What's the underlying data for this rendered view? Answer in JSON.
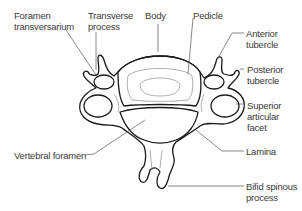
{
  "figure": {
    "labels": {
      "foramen_transversarium": [
        "Foramen",
        "transversarium"
      ],
      "transverse_process": [
        "Transverse",
        "process"
      ],
      "body": [
        "Body"
      ],
      "pedicle": [
        "Pedicle"
      ],
      "anterior_tubercle": [
        "Anterior",
        "tubercle"
      ],
      "posterior_tubercle": [
        "Posterior",
        "tubercle"
      ],
      "superior_articular_facet": [
        "Superior",
        "articular",
        "facet"
      ],
      "vertebral_foramen": [
        "Vertebral foramen"
      ],
      "lamina": [
        "Lamina"
      ],
      "bifid_spinous_process": [
        "Bifid spinous",
        "process"
      ]
    },
    "colors": {
      "outline": "#1a1a1a",
      "leader": "#555555",
      "text": "#3a3a3a",
      "inner_line": "#9a9a9a"
    }
  }
}
